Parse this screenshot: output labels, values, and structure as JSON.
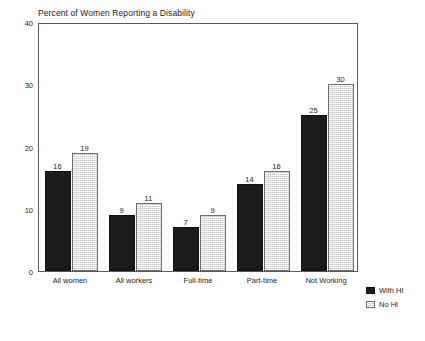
{
  "chart_data": {
    "type": "bar",
    "title": "Percent of Women Reporting a Disability",
    "xlabel": "",
    "ylabel": "",
    "ylim": [
      0,
      40
    ],
    "yticks": [
      0,
      10,
      20,
      30,
      40
    ],
    "grid": false,
    "legend_position": "right-bottom-outside",
    "categories": [
      "All women",
      "All workers",
      "Full-time",
      "Part-time",
      "Not Working"
    ],
    "series": [
      {
        "name": "With HI",
        "color": "#1c1c1c",
        "values": [
          16,
          9,
          7,
          14,
          25
        ]
      },
      {
        "name": "No HI",
        "color": "#c4c4c4",
        "values": [
          19,
          11,
          9,
          16,
          30
        ]
      }
    ]
  },
  "legend": {
    "items": [
      {
        "label": "With HI"
      },
      {
        "label": "No HI"
      }
    ]
  }
}
